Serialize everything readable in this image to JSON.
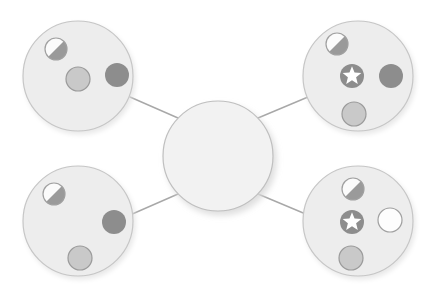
{
  "diagram": {
    "type": "node-link",
    "background_color": "#ffffff",
    "palette": {
      "node_fill": "#ededed",
      "node_stroke": "#c6c6c6",
      "hub_fill": "#f2f2f2",
      "hub_stroke": "#bfbfbf",
      "edge_color": "#a8a8a8",
      "marker_dark": "#8d8d8d",
      "marker_light": "#c9c9c9",
      "marker_light_stroke": "#9b9b9b",
      "marker_empty_fill": "#fdfdfd",
      "marker_empty_stroke": "#a0a0a0",
      "marker_half_light": "#fbfbfb",
      "marker_half_dark": "#9a9a9a",
      "star_fill": "#ffffff",
      "shadow_color": "#e2e2e2"
    },
    "hub": {
      "id": "hub",
      "label": "",
      "cx": 218,
      "cy": 156,
      "r": 55,
      "markers": []
    },
    "edges": [
      {
        "id": "edge-hub-top-left",
        "from": "hub",
        "to": "node-top-left",
        "x1": 178,
        "y1": 118,
        "x2": 130,
        "y2": 97
      },
      {
        "id": "edge-hub-top-right",
        "from": "hub",
        "to": "node-top-right",
        "x1": 258,
        "y1": 118,
        "x2": 308,
        "y2": 97
      },
      {
        "id": "edge-hub-bottom-left",
        "from": "hub",
        "to": "node-bottom-left",
        "x1": 178,
        "y1": 194,
        "x2": 130,
        "y2": 215
      },
      {
        "id": "edge-hub-bottom-right",
        "from": "hub",
        "to": "node-bottom-right",
        "x1": 258,
        "y1": 194,
        "x2": 308,
        "y2": 215
      }
    ],
    "nodes": [
      {
        "id": "node-top-left",
        "name": "node-top-left",
        "label": "",
        "cx": 78,
        "cy": 76,
        "r": 55,
        "markers": [
          {
            "id": "m1",
            "name": "half-filled-circle-marker",
            "kind": "half",
            "cx": 56,
            "cy": 49,
            "r": 11
          },
          {
            "id": "m2",
            "name": "light-circle-marker",
            "kind": "light",
            "cx": 78,
            "cy": 79,
            "r": 12
          },
          {
            "id": "m3",
            "name": "dark-circle-marker",
            "kind": "dark",
            "cx": 117,
            "cy": 75,
            "r": 12
          }
        ]
      },
      {
        "id": "node-top-right",
        "name": "node-top-right",
        "label": "",
        "cx": 358,
        "cy": 76,
        "r": 55,
        "markers": [
          {
            "id": "m1",
            "name": "half-filled-circle-marker",
            "kind": "half",
            "cx": 337,
            "cy": 44,
            "r": 11
          },
          {
            "id": "m2",
            "name": "star-badge-marker",
            "kind": "star",
            "cx": 352,
            "cy": 76,
            "r": 12
          },
          {
            "id": "m3",
            "name": "dark-circle-marker",
            "kind": "dark",
            "cx": 391,
            "cy": 76,
            "r": 12
          },
          {
            "id": "m4",
            "name": "light-circle-marker",
            "kind": "light",
            "cx": 354,
            "cy": 114,
            "r": 12
          }
        ]
      },
      {
        "id": "node-bottom-left",
        "name": "node-bottom-left",
        "label": "",
        "cx": 78,
        "cy": 221,
        "r": 55,
        "markers": [
          {
            "id": "m1",
            "name": "half-filled-circle-marker",
            "kind": "half",
            "cx": 54,
            "cy": 194,
            "r": 11
          },
          {
            "id": "m2",
            "name": "dark-circle-marker",
            "kind": "dark",
            "cx": 114,
            "cy": 222,
            "r": 12
          },
          {
            "id": "m3",
            "name": "light-circle-marker",
            "kind": "light",
            "cx": 80,
            "cy": 258,
            "r": 12
          }
        ]
      },
      {
        "id": "node-bottom-right",
        "name": "node-bottom-right",
        "label": "",
        "cx": 358,
        "cy": 221,
        "r": 55,
        "markers": [
          {
            "id": "m1",
            "name": "half-filled-circle-marker",
            "kind": "half",
            "cx": 353,
            "cy": 189,
            "r": 11
          },
          {
            "id": "m2",
            "name": "star-badge-marker",
            "kind": "star",
            "cx": 352,
            "cy": 222,
            "r": 12
          },
          {
            "id": "m3",
            "name": "empty-circle-marker",
            "kind": "empty",
            "cx": 390,
            "cy": 220,
            "r": 12
          },
          {
            "id": "m4",
            "name": "light-circle-marker",
            "kind": "light",
            "cx": 351,
            "cy": 258,
            "r": 12
          }
        ]
      }
    ]
  }
}
